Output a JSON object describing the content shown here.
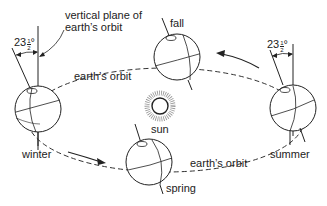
{
  "diagram": {
    "type": "earth-orbit-seasons",
    "labels": {
      "vertical_plane": [
        "vertical plane of",
        "earth’s orbit"
      ],
      "orbit_top_left": "earth’s orbit",
      "orbit_bottom_right": "earth’s orbit",
      "sun": "sun",
      "fall": "fall",
      "winter": "winter",
      "spring": "spring",
      "summer": "summer"
    },
    "tilt_angle": {
      "whole": "23",
      "numerator": "1",
      "denominator": "2",
      "unit": "°",
      "text": "23½°"
    },
    "positions": [
      {
        "name": "winter",
        "side": "left"
      },
      {
        "name": "fall",
        "side": "top"
      },
      {
        "name": "summer",
        "side": "right"
      },
      {
        "name": "spring",
        "side": "bottom"
      }
    ],
    "colors": {
      "line": "#222222",
      "background": "#ffffff"
    }
  }
}
